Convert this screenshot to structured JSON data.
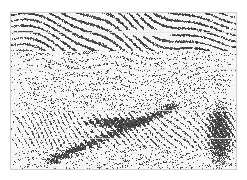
{
  "page": {
    "background_color": "#ffffff",
    "width": 247,
    "height": 180
  },
  "caption": {
    "left_text": "· · ·· ·· ··· · ·· ·· ···",
    "right_text": "·· · ··· ·",
    "color": "#f2f2f3",
    "note": "faded/illegible scan artifact strip"
  },
  "figure": {
    "name": "seismic-reflection-section",
    "frame_color": "#cfcfcf",
    "frame_x": 10,
    "frame_y": 12,
    "frame_width": 227,
    "frame_height": 158,
    "ink_color": "#3a3a3a",
    "paper_color": "#ffffff",
    "grid_line_color": "#e8e8ea",
    "grid_line_rows": [
      0.12,
      0.36,
      0.62,
      0.8
    ]
  },
  "chart_data": {
    "type": "heatmap",
    "title": "",
    "xlabel": "",
    "ylabel": "",
    "render": "variable-density seismic raster, black ink on white paper",
    "grid": true,
    "legend": "none",
    "nx": 225,
    "ny": 156,
    "noise": {
      "base_density": 0.34,
      "speckle_scale": 1,
      "seed": 20250117
    },
    "bands": [
      {
        "name": "upper-laminated-reflectors",
        "y_start": 0.0,
        "y_end": 0.24,
        "dip": -0.06,
        "amplitude": 0.82,
        "coherence": 0.86,
        "wavelength": 7
      },
      {
        "name": "transition-chaotic",
        "y_start": 0.24,
        "y_end": 0.42,
        "dip": 0.02,
        "amplitude": 0.55,
        "coherence": 0.42,
        "wavelength": 6
      },
      {
        "name": "mid-speckle-zone",
        "y_start": 0.42,
        "y_end": 0.64,
        "dip": 0.0,
        "amplitude": 0.48,
        "coherence": 0.3,
        "wavelength": 5
      },
      {
        "name": "lower-dipping-reflectors",
        "y_start": 0.64,
        "y_end": 0.86,
        "dip": -0.22,
        "amplitude": 0.72,
        "coherence": 0.62,
        "wavelength": 8
      },
      {
        "name": "basal-chaotic",
        "y_start": 0.86,
        "y_end": 1.0,
        "dip": 0.04,
        "amplitude": 0.5,
        "coherence": 0.34,
        "wavelength": 6
      }
    ],
    "features": [
      {
        "name": "bright-flat-lens",
        "x": 0.46,
        "y": 0.1,
        "w": 0.3,
        "h": 0.05,
        "polarity": "light"
      },
      {
        "name": "diagonal-fault-trend",
        "x0": 0.18,
        "y0": 0.94,
        "x1": 0.72,
        "y1": 0.6,
        "polarity": "dark"
      },
      {
        "name": "anticline-crest",
        "x": 0.3,
        "y": 0.66,
        "w": 0.34,
        "h": 0.08,
        "polarity": "dark"
      },
      {
        "name": "right-edge-noise-wedge",
        "x": 0.86,
        "y": 0.55,
        "w": 0.14,
        "h": 0.45,
        "polarity": "dark"
      }
    ]
  }
}
